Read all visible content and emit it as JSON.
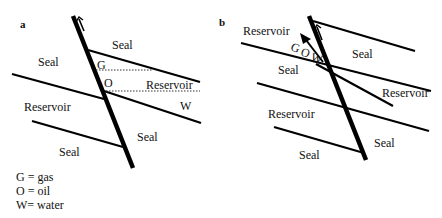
{
  "panels": {
    "a": {
      "label": "a",
      "texts": {
        "seal_top": "Seal",
        "seal_left": "Seal",
        "gas": "G",
        "oil": "O",
        "reservoir_right": "Reservoir",
        "water": "W",
        "reservoir_left": "Reservoir",
        "seal_right_lower": "Seal",
        "seal_bottom": "Seal"
      }
    },
    "b": {
      "label": "b",
      "texts": {
        "reservoir_top_left": "Reservoir",
        "gas": "G",
        "oil": "O",
        "water": "W",
        "seal_mid_right": "Seal",
        "seal_mid_left": "Seal",
        "reservoir_right": "Reservoir",
        "reservoir_left": "Reservoir",
        "seal_right_lower": "Seal",
        "seal_bottom": "Seal"
      }
    }
  },
  "legend": [
    {
      "text": "G = gas"
    },
    {
      "text": "O = oil"
    },
    {
      "text": "W= water"
    }
  ]
}
